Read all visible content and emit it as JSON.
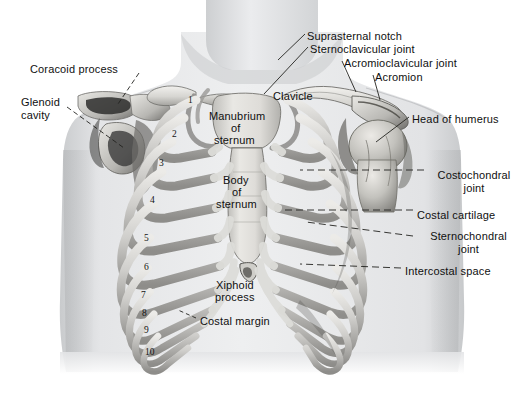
{
  "figure": {
    "background_color": "#ffffff",
    "skin_color": "#ebecee",
    "bone_color": "#d2d2d0",
    "label_color": "#101010",
    "leader_color": "#2b2b2b"
  },
  "labels_left": [
    {
      "id": "coracoid-process",
      "text": "Coracoid process",
      "x": 30,
      "y": 63,
      "align": "left"
    },
    {
      "id": "glenoid-cavity",
      "text": "Glenoid",
      "x": 21,
      "y": 96,
      "align": "left"
    },
    {
      "id": "glenoid-cavity-2",
      "text": "cavity",
      "x": 21,
      "y": 109,
      "align": "left"
    }
  ],
  "labels_top_right": [
    {
      "id": "suprasternal-notch",
      "text": "Suprasternal notch",
      "x": 307,
      "y": 30
    },
    {
      "id": "sternoclavicular-joint",
      "text": "Sternoclavicular joint",
      "x": 310,
      "y": 43
    },
    {
      "id": "acromioclavicular-joint",
      "text": "Acromioclavicular joint",
      "x": 344,
      "y": 57
    },
    {
      "id": "acromion",
      "text": "Acromion",
      "x": 375,
      "y": 71
    },
    {
      "id": "head-of-humerus",
      "text": "Head of humerus",
      "x": 412,
      "y": 113
    }
  ],
  "labels_right": [
    {
      "id": "costochondral-joint",
      "line1": "Costochondral",
      "line2": "joint",
      "x": 428,
      "y": 169
    },
    {
      "id": "costal-cartilage",
      "line1": "Costal cartilage",
      "line2": "",
      "x": 417,
      "y": 209
    },
    {
      "id": "sternochondral-joint",
      "line1": "Sternochondral",
      "line2": "joint",
      "x": 417,
      "y": 230
    },
    {
      "id": "intercostal-space",
      "line1": "Intercostal space",
      "line2": "",
      "x": 405,
      "y": 265
    }
  ],
  "labels_center": [
    {
      "id": "clavicle",
      "text": "Clavicle",
      "x": 273,
      "y": 90
    },
    {
      "id": "manubrium-line-1",
      "text": "Manubrium",
      "x": 209,
      "y": 110
    },
    {
      "id": "manubrium-line-2",
      "text": "of",
      "x": 231,
      "y": 122
    },
    {
      "id": "manubrium-line-3",
      "text": "sternum",
      "x": 214,
      "y": 134
    },
    {
      "id": "body-line-1",
      "text": "Body",
      "x": 223,
      "y": 174
    },
    {
      "id": "body-line-2",
      "text": "of",
      "x": 232,
      "y": 186
    },
    {
      "id": "body-line-3",
      "text": "sternum",
      "x": 216,
      "y": 198
    },
    {
      "id": "xiphoid-line-1",
      "text": "Xiphoid",
      "x": 216,
      "y": 279
    },
    {
      "id": "xiphoid-line-2",
      "text": "process",
      "x": 215,
      "y": 291
    },
    {
      "id": "costal-margin",
      "text": "Costal margin",
      "x": 200,
      "y": 315
    }
  ],
  "rib_numbers": [
    {
      "n": "1",
      "x": 188,
      "y": 95
    },
    {
      "n": "2",
      "x": 172,
      "y": 129
    },
    {
      "n": "3",
      "x": 159,
      "y": 158
    },
    {
      "n": "4",
      "x": 150,
      "y": 195
    },
    {
      "n": "5",
      "x": 144,
      "y": 233
    },
    {
      "n": "6",
      "x": 144,
      "y": 262
    },
    {
      "n": "7",
      "x": 141,
      "y": 290
    },
    {
      "n": "8",
      "x": 142,
      "y": 308
    },
    {
      "n": "9",
      "x": 144,
      "y": 325
    },
    {
      "n": "10",
      "x": 145,
      "y": 347
    }
  ],
  "signature": {
    "text": "artist signature",
    "x": 398,
    "y": 368
  }
}
